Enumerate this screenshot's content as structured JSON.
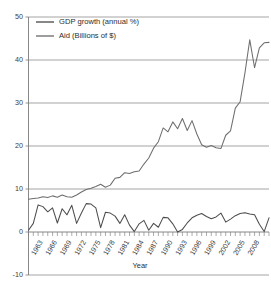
{
  "chart_data": {
    "type": "line",
    "title": "",
    "xlabel": "Year",
    "ylabel": "",
    "grid": true,
    "legend_position": "top-left",
    "ylim": [
      -10,
      50
    ],
    "ytick_labels": [
      "50",
      "40",
      "30",
      "20",
      "10",
      "0",
      "-10"
    ],
    "ytick_values": [
      50,
      40,
      30,
      20,
      10,
      0,
      -10
    ],
    "xlim": [
      1960,
      2010
    ],
    "xtick_labels": [
      "1963",
      "1966",
      "1969",
      "1972",
      "1975",
      "1978",
      "1981",
      "1984",
      "1987",
      "1990",
      "1993",
      "1996",
      "1999",
      "2002",
      "2005",
      "2008"
    ],
    "xtick_values": [
      1963,
      1966,
      1969,
      1972,
      1975,
      1978,
      1981,
      1984,
      1987,
      1990,
      1993,
      1996,
      1999,
      2002,
      2005,
      2008
    ],
    "x": [
      1960,
      1961,
      1962,
      1963,
      1964,
      1965,
      1966,
      1967,
      1968,
      1969,
      1970,
      1971,
      1972,
      1973,
      1974,
      1975,
      1976,
      1977,
      1978,
      1979,
      1980,
      1981,
      1982,
      1983,
      1984,
      1985,
      1986,
      1987,
      1988,
      1989,
      1990,
      1991,
      1992,
      1993,
      1994,
      1995,
      1996,
      1997,
      1998,
      1999,
      2000,
      2001,
      2002,
      2003,
      2004,
      2005,
      2006,
      2007,
      2008,
      2009,
      2010
    ],
    "series": [
      {
        "name": "GDP growth (annual %)",
        "color": "#4d4d4d",
        "values": [
          0.4,
          2.0,
          6.3,
          5.9,
          4.7,
          5.6,
          2.1,
          5.4,
          4.0,
          6.2,
          2.0,
          4.4,
          6.6,
          6.5,
          5.6,
          1.0,
          4.6,
          4.4,
          3.7,
          2.0,
          4.0,
          1.6,
          0.1,
          1.9,
          2.7,
          0.4,
          2.0,
          1.1,
          3.4,
          3.3,
          1.9,
          0.0,
          0.6,
          2.1,
          3.3,
          3.9,
          4.3,
          3.6,
          3.1,
          3.5,
          4.4,
          2.3,
          3.0,
          3.8,
          4.3,
          4.5,
          4.2,
          4.0,
          1.8,
          0.1,
          3.3
        ]
      },
      {
        "name": "Aid (Billions of $)",
        "color": "#6e6e6e",
        "values": [
          7.6,
          7.8,
          7.9,
          8.2,
          8.0,
          8.4,
          8.1,
          8.6,
          8.2,
          8.1,
          8.6,
          9.3,
          9.9,
          10.2,
          10.6,
          11.1,
          10.4,
          10.9,
          12.5,
          12.7,
          13.8,
          13.6,
          14.0,
          14.2,
          15.8,
          17.2,
          19.5,
          21.0,
          24.2,
          23.3,
          25.6,
          24.0,
          26.4,
          23.6,
          25.9,
          22.8,
          20.3,
          19.7,
          20.1,
          19.6,
          19.4,
          22.5,
          23.5,
          28.8,
          30.3,
          37.0,
          44.7,
          38.2,
          42.8,
          44.0,
          44.1
        ]
      }
    ],
    "legend": [
      {
        "label": "GDP growth (annual %)",
        "color": "#4d4d4d"
      },
      {
        "label": "Aid (Billions of $)",
        "color": "#6e6e6e"
      }
    ]
  },
  "figure": {
    "background": "#ffffff",
    "axis_color": "#7b7b7b",
    "grid_color": "#8d8d8d",
    "text_color": "#2d2d2d"
  }
}
